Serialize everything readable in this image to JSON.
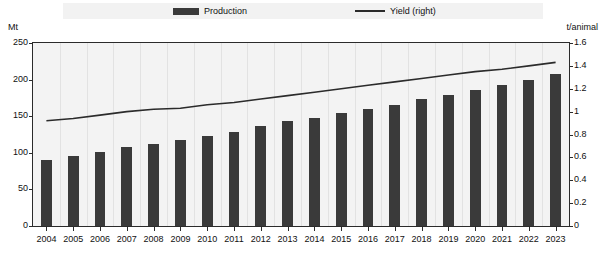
{
  "legend": {
    "production_label": "Production",
    "yield_label": "Yield (right)",
    "production_color": "#3a3a3a",
    "yield_color": "#2b2b2b"
  },
  "axes": {
    "left_unit": "Mt",
    "right_unit": "t/animal"
  },
  "chart_data": {
    "type": "bar",
    "title": "",
    "subtitle": "",
    "xlabel": "",
    "ylabel": "Mt",
    "y2label": "t/animal",
    "ylim": [
      0,
      250
    ],
    "y2lim": [
      0,
      1.6
    ],
    "yticks": [
      0,
      50,
      100,
      150,
      200,
      250
    ],
    "ytick_labels": [
      "0",
      "50",
      "100",
      "150",
      "200",
      "250"
    ],
    "y2ticks": [
      0,
      0.2,
      0.4,
      0.6,
      0.8,
      1,
      1.2,
      1.4,
      1.6
    ],
    "y2tick_labels": [
      "0",
      "0.2",
      "0.4",
      "0.6",
      "0.8",
      "1",
      "1.2",
      "1.4",
      "1.6"
    ],
    "grid": "vertical",
    "legend_position": "top",
    "categories": [
      "2004",
      "2005",
      "2006",
      "2007",
      "2008",
      "2009",
      "2007",
      "2011",
      "2012",
      "2013",
      "2014",
      "2015",
      "2016",
      "2017",
      "2018",
      "2019",
      "2020",
      "2021",
      "2022",
      "2023"
    ],
    "x": [
      "2004",
      "2005",
      "2006",
      "2007",
      "2008",
      "2009",
      "2010",
      "2011",
      "2012",
      "2013",
      "2014",
      "2015",
      "2016",
      "2017",
      "2018",
      "2019",
      "2020",
      "2021",
      "2022",
      "2023"
    ],
    "series": [
      {
        "name": "Production",
        "type": "bar",
        "axis": "left",
        "unit": "Mt",
        "color": "#3a3a3a",
        "values": [
          90,
          96,
          101,
          108,
          112,
          117,
          123,
          129,
          136,
          143,
          148,
          154,
          160,
          166,
          173,
          179,
          186,
          193,
          199,
          208
        ]
      },
      {
        "name": "Yield (right)",
        "type": "line",
        "axis": "right",
        "unit": "t/animal",
        "color": "#2b2b2b",
        "values": [
          0.92,
          0.94,
          0.97,
          1.0,
          1.02,
          1.03,
          1.06,
          1.08,
          1.11,
          1.14,
          1.17,
          1.2,
          1.23,
          1.26,
          1.29,
          1.32,
          1.35,
          1.37,
          1.4,
          1.43
        ]
      }
    ]
  }
}
